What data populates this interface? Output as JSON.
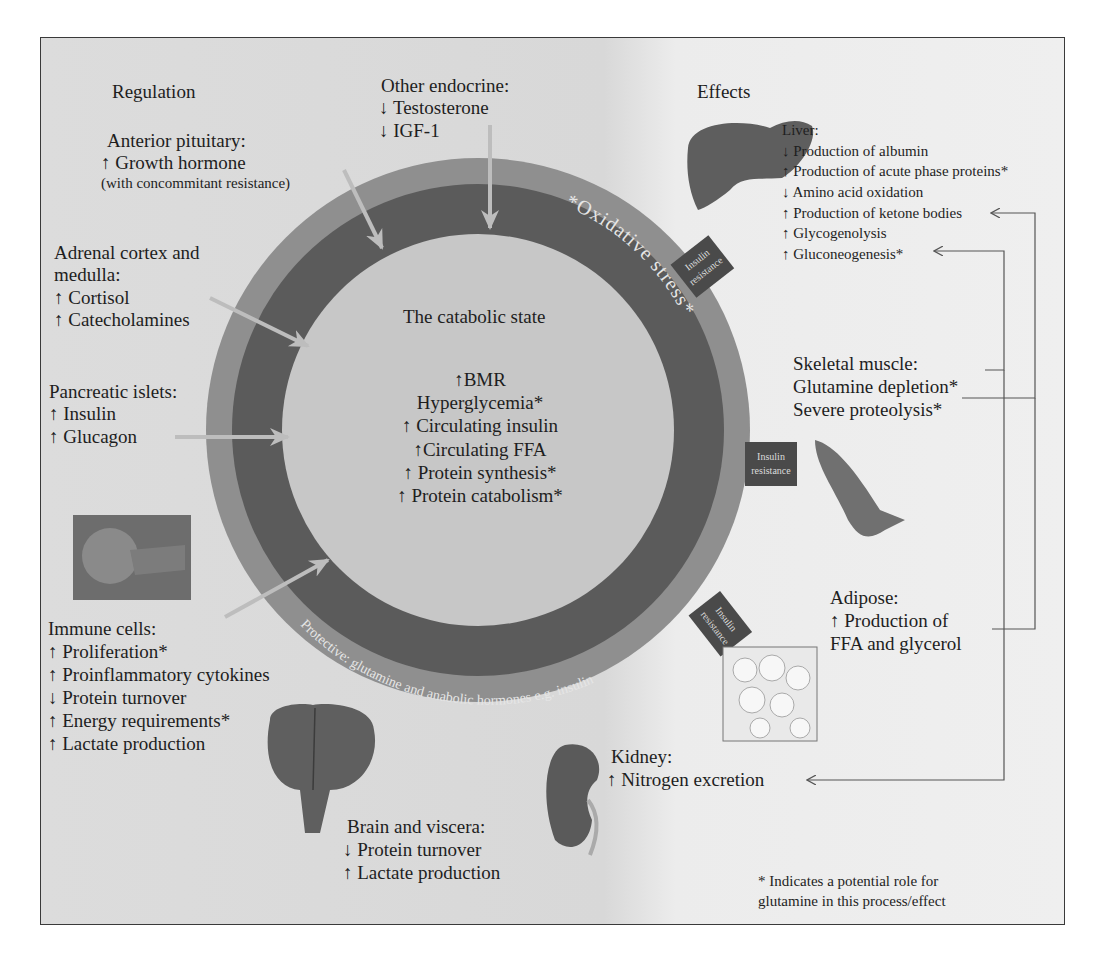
{
  "sections": {
    "regulation_title": "Regulation",
    "effects_title": "Effects"
  },
  "regulation": {
    "other_endocrine": {
      "title": "Other endocrine:",
      "items": [
        "↓ Testosterone",
        "↓ IGF-1"
      ]
    },
    "anterior_pituitary": {
      "title": "Anterior pituitary:",
      "items": [
        "↑ Growth hormone"
      ],
      "note": "(with concommitant resistance)"
    },
    "adrenal": {
      "title_line1": "Adrenal cortex and",
      "title_line2": "medulla:",
      "items": [
        "↑ Cortisol",
        "↑ Catecholamines"
      ]
    },
    "pancreatic": {
      "title": "Pancreatic islets:",
      "items": [
        "↑ Insulin",
        "↑ Glucagon"
      ]
    },
    "immune": {
      "title": "Immune cells:",
      "items": [
        "↑ Proliferation*",
        "↑ Proinflammatory cytokines",
        "↓ Protein turnover",
        "↑ Energy requirements*",
        "↑ Lactate production"
      ]
    }
  },
  "center": {
    "title": "The catabolic state",
    "items": [
      "↑BMR",
      "Hyperglycemia*",
      "↑ Circulating insulin",
      "↑Circulating FFA",
      "↑ Protein synthesis*",
      "↑ Protein catabolism*"
    ]
  },
  "rings": {
    "oxidative_stress": "*Oxidative stress*",
    "protective": "Protective: glutamine and anabolic hormones e.g. insulin",
    "insulin_resistance_tags": [
      "Insulin resistance",
      "Insulin resistance",
      "Insulin resistance"
    ],
    "colors": {
      "outer": "#8f8f8f",
      "dark": "#5a5a5a",
      "inner": "#c6c6c6",
      "tag": "#4a4a4a"
    }
  },
  "effects": {
    "liver": {
      "title": "Liver:",
      "items": [
        "↓ Production of albumin",
        "↑ Production of acute phase proteins*",
        "↓ Amino acid oxidation",
        "↑ Production of ketone bodies",
        "↑ Glycogenolysis",
        "↑ Gluconeogenesis*"
      ]
    },
    "skeletal_muscle": {
      "title": "Skeletal muscle:",
      "items": [
        "Glutamine depletion*",
        "Severe proteolysis*"
      ]
    },
    "adipose": {
      "title": "Adipose:",
      "items": [
        "↑ Production of",
        "FFA and glycerol"
      ]
    },
    "kidney": {
      "title": "Kidney:",
      "items": [
        "↑ Nitrogen excretion"
      ]
    },
    "brain": {
      "title": "Brain and viscera:",
      "items": [
        "↓ Protein turnover",
        "↑ Lactate production"
      ]
    }
  },
  "footnote": [
    "* Indicates a potential role for",
    "glutamine in this process/effect"
  ],
  "images": [
    "immune-cell-micrograph",
    "liver",
    "skeletal-muscle",
    "adipose-tissue-micrograph",
    "brain",
    "kidney"
  ]
}
